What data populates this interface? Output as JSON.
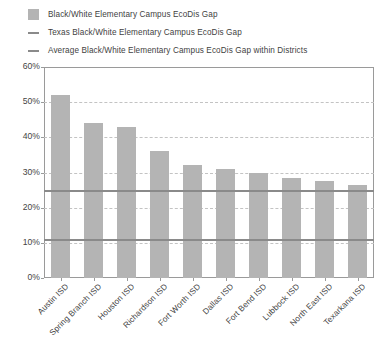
{
  "legend": {
    "items": [
      {
        "marker": "swatch",
        "label": "Black/White Elementary Campus EcoDis Gap",
        "color": "#b4b4b4"
      },
      {
        "marker": "line",
        "label": "Texas Black/White Elementary Campus EcoDis Gap",
        "color": "#8a8a8a"
      },
      {
        "marker": "line",
        "label": "Average Black/White Elementary Campus EcoDis Gap within Districts",
        "color": "#8a8a8a"
      }
    ]
  },
  "axis": {
    "y_ticks": [
      "60%",
      "50%",
      "40%",
      "30%",
      "20%",
      "10%",
      "0%"
    ],
    "y_tick_values": [
      60,
      50,
      40,
      30,
      20,
      10,
      0
    ]
  },
  "chart_data": {
    "type": "bar",
    "title": "",
    "subtitle": "",
    "xlabel": "",
    "ylabel": "",
    "ylim": [
      0,
      60
    ],
    "ytick_step": 10,
    "ytick_format": "percent",
    "grid": "horizontal-dashed",
    "legend_position": "top-left",
    "bar_color": "#b4b4b4",
    "categories": [
      "Austin ISD",
      "Spring Branch ISD",
      "Houston ISD",
      "Richardson ISD",
      "Fort Worth ISD",
      "Dallas ISD",
      "Fort Bend ISD",
      "Lubbock ISD",
      "North East ISD",
      "Texarkana ISD"
    ],
    "series": [
      {
        "name": "Black/White Elementary Campus EcoDis Gap",
        "type": "bar",
        "values": [
          52,
          44,
          43,
          36,
          32,
          31,
          30,
          28.5,
          27.5,
          26.5
        ]
      }
    ],
    "reference_lines": [
      {
        "name": "Texas Black/White Elementary Campus EcoDis Gap",
        "value": 25,
        "color": "#8a8a8a"
      },
      {
        "name": "Average Black/White Elementary Campus EcoDis Gap within Districts",
        "value": 11,
        "color": "#8a8a8a"
      }
    ]
  }
}
